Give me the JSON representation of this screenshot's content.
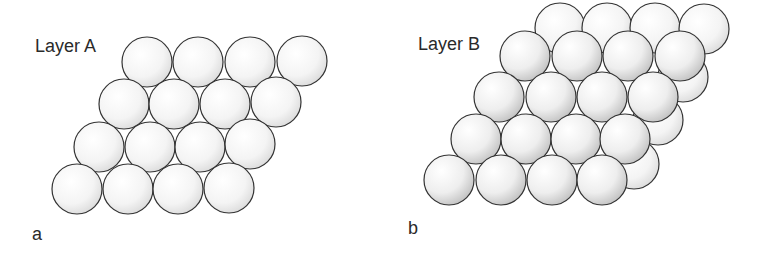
{
  "panels": [
    {
      "id": "a",
      "title": "Layer A",
      "letter": "a",
      "title_pos": [
        35,
        36
      ],
      "letter_pos": [
        32,
        224
      ],
      "layers": [
        {
          "name": "Layer A",
          "shade": "light",
          "circles": [
            [
              147,
              62
            ],
            [
              198,
              62
            ],
            [
              250,
              62
            ],
            [
              302,
              61
            ],
            [
              124,
              104
            ],
            [
              174,
              104
            ],
            [
              225,
              104
            ],
            [
              276,
              102
            ],
            [
              99,
              147
            ],
            [
              150,
              147
            ],
            [
              200,
              147
            ],
            [
              250,
              144
            ],
            [
              77,
              189
            ],
            [
              128,
              189
            ],
            [
              178,
              189
            ],
            [
              229,
              188
            ]
          ]
        }
      ]
    },
    {
      "id": "b",
      "title": "Layer B",
      "letter": "b",
      "title_pos": [
        418,
        34
      ],
      "letter_pos": [
        408,
        218
      ],
      "layers": [
        {
          "name": "Layer A (below)",
          "shade": "light",
          "circles": [
            [
              560,
              28
            ],
            [
              607,
              28
            ],
            [
              655,
              28
            ],
            [
              704,
              29
            ],
            [
              683,
              77
            ],
            [
              658,
              120
            ],
            [
              634,
              164
            ]
          ]
        },
        {
          "name": "Layer B (on top)",
          "shade": "dark",
          "circles": [
            [
              525,
              56
            ],
            [
              577,
              56
            ],
            [
              628,
              56
            ],
            [
              680,
              56
            ],
            [
              499,
              97
            ],
            [
              551,
              97
            ],
            [
              602,
              97
            ],
            [
              653,
              97
            ],
            [
              476,
              139
            ],
            [
              526,
              139
            ],
            [
              576,
              139
            ],
            [
              625,
              139
            ],
            [
              449,
              180
            ],
            [
              501,
              180
            ],
            [
              552,
              180
            ],
            [
              602,
              180
            ]
          ]
        }
      ]
    }
  ],
  "style": {
    "radius": 25,
    "stroke": "#333333",
    "fill_light_center": "#ffffff",
    "fill_light_edge": "#d9d9d9",
    "fill_dark_center": "#ffffff",
    "fill_dark_edge": "#bdbdbd"
  }
}
